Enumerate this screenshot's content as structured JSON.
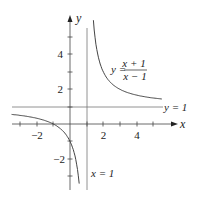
{
  "chart_data": {
    "type": "line",
    "title": "",
    "xlabel": "x",
    "ylabel": "y",
    "xlim": [
      -3.5,
      6.3
    ],
    "ylim": [
      -3.9,
      6.3
    ],
    "grid": false,
    "x_tick_labels": [
      "-2",
      "2",
      "4"
    ],
    "y_tick_labels": [
      "4",
      "2",
      "-2"
    ],
    "x_ticks": [
      -3,
      -2,
      -1,
      1,
      2,
      3,
      4,
      5
    ],
    "y_ticks": [
      -3,
      -2,
      -1,
      1,
      2,
      3,
      4,
      5
    ],
    "series": [
      {
        "name": "y = (x + 1)/(x - 1)",
        "function": "(x+1)/(x-1)",
        "branches": [
          [
            -3.5,
            0.55
          ],
          [
            1.4,
            5.5
          ]
        ]
      }
    ],
    "asymptotes": [
      {
        "type": "vertical",
        "value": 1,
        "label": "x = 1"
      },
      {
        "type": "horizontal",
        "value": 1,
        "label": "y = 1"
      }
    ],
    "annotations": [
      {
        "text": "y =",
        "numerator": "x + 1",
        "denominator": "x − 1"
      }
    ]
  },
  "labels": {
    "x_axis": "x",
    "y_axis": "y",
    "eq_prefix": "y =",
    "eq_num": "x + 1",
    "eq_den": "x − 1",
    "hasym": "y = 1",
    "vasym": "x = 1",
    "tick_x_m2": "−2",
    "tick_x_2": "2",
    "tick_x_4": "4",
    "tick_y_4": "4",
    "tick_y_2": "2",
    "tick_y_m2": "−2"
  }
}
